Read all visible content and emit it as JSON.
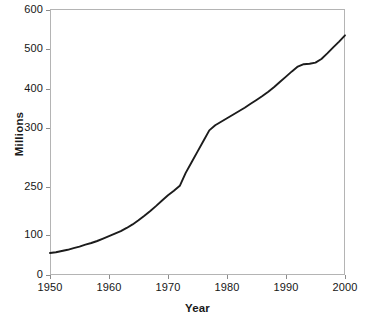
{
  "chart_data": {
    "type": "line",
    "title": "",
    "xlabel": "Year",
    "ylabel": "Millions",
    "grid": false,
    "legend": null,
    "line_color": "#1c1c1c",
    "frame_color": "#b4b4b4",
    "xlim": [
      1950,
      2000
    ],
    "ylim": [
      0,
      600
    ],
    "xticks": [
      1950,
      1960,
      1970,
      1980,
      1990,
      2000
    ],
    "xtick_labels": [
      "1950",
      "1960",
      "1970",
      "1980",
      "1990",
      "2000"
    ],
    "yticks": [
      0,
      100,
      250,
      300,
      400,
      500,
      600
    ],
    "ytick_labels": [
      "0",
      "100",
      "250",
      "300",
      "400",
      "500",
      "600"
    ],
    "ytick_positions_px": [
      275,
      235,
      187,
      128,
      89,
      49,
      10
    ],
    "x": [
      1950,
      1951,
      1952,
      1953,
      1954,
      1955,
      1956,
      1957,
      1958,
      1959,
      1960,
      1961,
      1962,
      1963,
      1964,
      1965,
      1966,
      1967,
      1968,
      1969,
      1970,
      1971,
      1972,
      1973,
      1974,
      1975,
      1976,
      1977,
      1978,
      1979,
      1980,
      1981,
      1982,
      1983,
      1984,
      1985,
      1986,
      1987,
      1988,
      1989,
      1990,
      1991,
      1992,
      1993,
      1994,
      1995,
      1996,
      1997,
      1998,
      1999,
      2000
    ],
    "values": [
      55,
      57,
      60,
      63,
      67,
      71,
      76,
      80,
      85,
      91,
      97,
      104,
      112,
      122,
      133,
      146,
      160,
      175,
      191,
      208,
      224,
      238,
      251,
      262,
      271,
      280,
      289,
      298,
      307,
      316,
      325,
      334,
      343,
      352,
      362,
      372,
      382,
      393,
      405,
      418,
      431,
      444,
      456,
      462,
      463,
      466,
      475,
      489,
      504,
      519,
      535
    ],
    "series_name": "",
    "annotations": []
  },
  "axis": {
    "y_title": "Millions",
    "x_title": "Year"
  }
}
